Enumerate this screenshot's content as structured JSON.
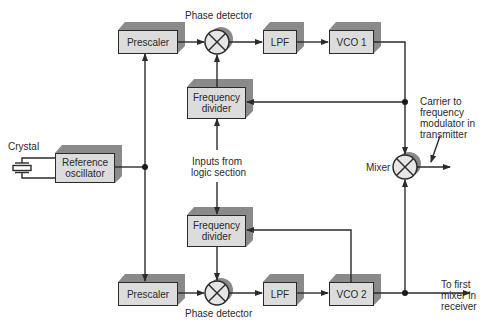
{
  "diagram": {
    "type": "block-diagram",
    "colors": {
      "box_fill": "#dcdcdc",
      "box_shadow": "#8a8a8a",
      "line": "#2b2b2b",
      "background": "#ffffff"
    },
    "blocks": {
      "prescaler_top": "Prescaler",
      "lpf_top": "LPF",
      "vco1": "VCO 1",
      "freq_divider_top_l1": "Frequency",
      "freq_divider_top_l2": "divider",
      "ref_osc_l1": "Reference",
      "ref_osc_l2": "oscillator",
      "freq_divider_bottom_l1": "Frequency",
      "freq_divider_bottom_l2": "divider",
      "prescaler_bottom": "Prescaler",
      "lpf_bottom": "LPF",
      "vco2": "VCO 2"
    },
    "labels": {
      "phase_detector_top": "Phase detector",
      "phase_detector_bottom": "Phase detector",
      "crystal": "Crystal",
      "inputs_l1": "Inputs from",
      "inputs_l2": "logic section",
      "mixer": "Mixer",
      "carrier_l1": "Carrier to",
      "carrier_l2": "frequency",
      "carrier_l3": "modulator in",
      "carrier_l4": "transmitter",
      "receiver_l1": "To first",
      "receiver_l2": "mixer in",
      "receiver_l3": "receiver"
    },
    "connections": [
      "Reference oscillator -> Prescaler (top)",
      "Reference oscillator -> Prescaler (bottom)",
      "Prescaler (top) -> Phase detector (top)",
      "Phase detector (top) -> LPF (top)",
      "LPF (top) -> VCO 1",
      "VCO 1 -> Frequency divider (top) [feedback]",
      "Frequency divider (top) -> Phase detector (top)",
      "Inputs from logic section -> Frequency divider (top)",
      "Inputs from logic section -> Frequency divider (bottom)",
      "Prescaler (bottom) -> Phase detector (bottom)",
      "Phase detector (bottom) -> LPF (bottom)",
      "LPF (bottom) -> VCO 2",
      "VCO 2 -> Frequency divider (bottom) [feedback]",
      "Frequency divider (bottom) -> Phase detector (bottom)",
      "VCO 1 -> Mixer",
      "VCO 2 -> Mixer",
      "Mixer -> Carrier to frequency modulator in transmitter",
      "VCO 2 -> To first mixer in receiver"
    ]
  }
}
